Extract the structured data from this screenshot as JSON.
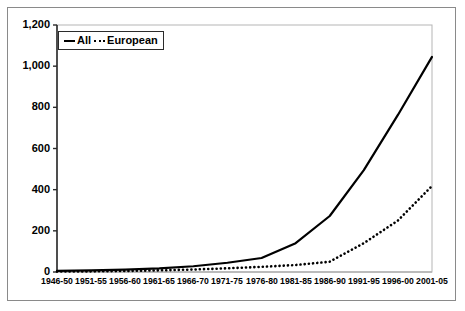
{
  "figure": {
    "background_color": "#ffffff",
    "frame_color": "#8a8a8a",
    "axis_color": "#000000"
  },
  "legend": {
    "position": "top-left-inside",
    "entries": [
      {
        "label": "All",
        "style": "solid",
        "icon": "solid-line-icon",
        "color": "#000000"
      },
      {
        "label": "European",
        "style": "dotted",
        "icon": "dotted-line-icon",
        "color": "#000000"
      }
    ]
  },
  "chart_data": {
    "type": "line",
    "title": "",
    "xlabel": "",
    "ylabel": "",
    "categories": [
      "1946-50",
      "1951-55",
      "1956-60",
      "1961-65",
      "1966-70",
      "1971-75",
      "1976-80",
      "1981-85",
      "1986-90",
      "1991-95",
      "1996-00",
      "2001-05"
    ],
    "series": [
      {
        "name": "All",
        "style": "solid",
        "color": "#000000",
        "values": [
          5,
          8,
          12,
          18,
          28,
          45,
          68,
          140,
          272,
          495,
          763,
          1045
        ]
      },
      {
        "name": "European",
        "style": "dotted",
        "color": "#000000",
        "values": [
          2,
          3,
          5,
          8,
          12,
          18,
          25,
          34,
          50,
          140,
          250,
          418
        ]
      }
    ],
    "ylim": [
      0,
      1200
    ],
    "yticks": [
      0,
      200,
      400,
      600,
      800,
      1000,
      1200
    ],
    "ytick_labels": [
      "0",
      "200",
      "400",
      "600",
      "800",
      "1,000",
      "1,200"
    ],
    "grid": false,
    "legend_position": "upper left"
  }
}
